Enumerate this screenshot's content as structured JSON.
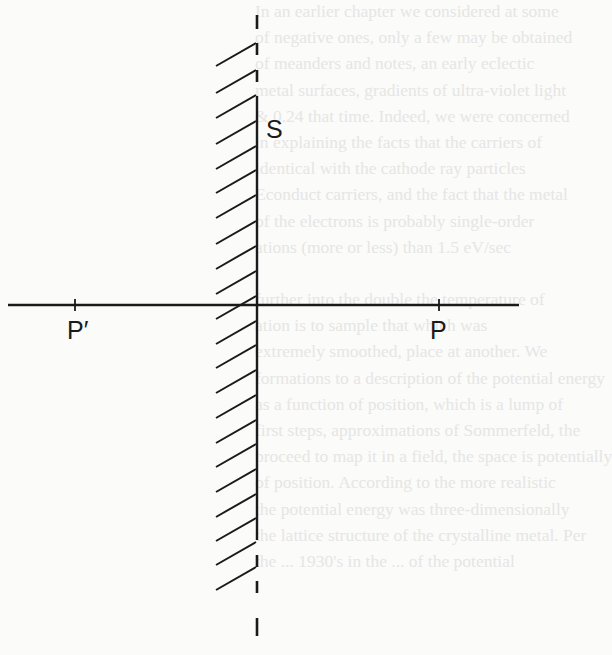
{
  "figure": {
    "surface_label": "S",
    "left_point_label": "P′",
    "right_point_label": "P",
    "line_color": "#1a1a1a",
    "background_color": "#fbfbfa"
  },
  "show_through_text": {
    "color": "#e6e6e4",
    "lines": [
      "In an earlier chapter we considered at some",
      "of negative ones, only a few may be obtained",
      "of meanders and notes, an early eclectic",
      "metal surfaces, gradients of ultra-violet light",
      "& 0.24 that time. Indeed, we were concerned",
      "in explaining the facts that the carriers of",
      "identical with the cathode ray particles",
      "Econduct carriers, and the fact that the metal",
      "of the electrons is probably single-order",
      "ations (more or less) than 1.5 eV/sec",
      "",
      "further into the double the temperature of",
      "ation is to sample that which was",
      "extremely smoothed, place at another. We",
      "formations to a description of the potential energy",
      "as a function of position, which is a lump of",
      "first steps, approximations of Sommerfeld, the",
      "proceed to map it in a field, the space is potentially",
      "of position. According to the more realistic",
      "the potential energy was three-dimensionally",
      "the lattice structure of the crystalline metal. Per",
      "the ... 1930's in the ... of the potential"
    ]
  }
}
